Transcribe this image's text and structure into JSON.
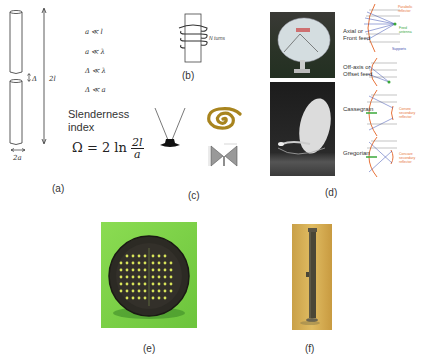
{
  "figure": {
    "panels": {
      "a": {
        "caption": "(a)",
        "conditions": [
          "a ≪ l",
          "a ≪ λ",
          "Δ ≪ λ",
          "Δ ≪ a"
        ],
        "gap_label": "Δ",
        "length_label": "2l",
        "diameter_label": "2a",
        "slenderness_title_line1": "Slenderness",
        "slenderness_title_line2": "index",
        "formula_lhs": "Ω = 2 ln",
        "formula_num": "2l",
        "formula_den": "a"
      },
      "b": {
        "caption": "(b)",
        "turns_label": "N turns"
      },
      "c": {
        "caption": "(c)",
        "items": [
          "rabbit-ear-dipole",
          "spiral-antenna",
          "bowtie-antenna"
        ]
      },
      "d": {
        "caption": "(d)",
        "feed_types": [
          {
            "label_line1": "Axial or",
            "label_line2": "Front feed"
          },
          {
            "label_line1": "Off-axis or",
            "label_line2": "Offset feed"
          },
          {
            "label_line1": "Cassegrain",
            "label_line2": ""
          },
          {
            "label_line1": "Gregorian",
            "label_line2": ""
          }
        ],
        "annotations": {
          "parabolic_reflector": "Parabolic reflector",
          "feed_antenna": "Feed antenna",
          "supports": "Supports",
          "convex_secondary": "Convex secondary reflector",
          "concave_secondary": "Concave secondary reflector"
        }
      },
      "e": {
        "caption": "(e)"
      },
      "f": {
        "caption": "(f)"
      }
    },
    "colors": {
      "reflector": "#e8733a",
      "feed": "#3aa83a",
      "support": "#3a4fb0",
      "green_bg": "#7ed24a",
      "gold_bg": "#d8b050",
      "spiral_gold": "#a8841e"
    }
  }
}
